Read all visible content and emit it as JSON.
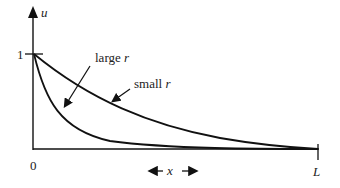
{
  "diagram": {
    "y_axis_label": "u",
    "x_axis_label": "x",
    "y_tick_label": "1",
    "origin_label": "0",
    "end_label": "L",
    "curves": [
      {
        "name": "large-r-curve",
        "label_prefix": "large",
        "label_var": "r"
      },
      {
        "name": "small-r-curve",
        "label_prefix": "small",
        "label_var": "r"
      }
    ]
  }
}
